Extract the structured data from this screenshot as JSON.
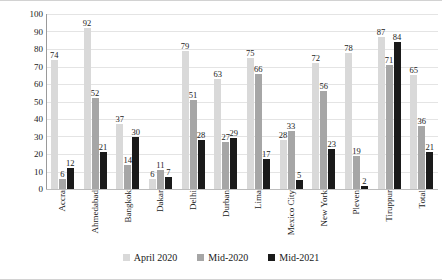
{
  "chart_data": {
    "type": "bar",
    "title": "",
    "xlabel": "",
    "ylabel": "Percentage not able to work",
    "ylim": [
      0,
      100
    ],
    "ytick_step": 10,
    "yticks": [
      100,
      90,
      80,
      70,
      60,
      50,
      40,
      30,
      20,
      10,
      0
    ],
    "grid": true,
    "legend_position": "bottom",
    "categories": [
      "Accra",
      "Ahmedabad",
      "Bangkok",
      "Dakar",
      "Delhi",
      "Durban",
      "Lima",
      "Mexico City",
      "New York",
      "Pleven",
      "Tiruppur",
      "Total"
    ],
    "series": [
      {
        "name": "April 2020",
        "color": "#d9d9d9",
        "values": [
          74,
          92,
          37,
          6,
          79,
          63,
          75,
          28,
          72,
          78,
          87,
          65
        ]
      },
      {
        "name": "Mid-2020",
        "color": "#a6a6a6",
        "values": [
          6,
          52,
          14,
          11,
          51,
          27,
          66,
          33,
          56,
          19,
          71,
          36
        ]
      },
      {
        "name": "Mid-2021",
        "color": "#1a1a1a",
        "values": [
          12,
          21,
          30,
          7,
          28,
          29,
          17,
          5,
          23,
          2,
          84,
          21
        ]
      }
    ]
  }
}
